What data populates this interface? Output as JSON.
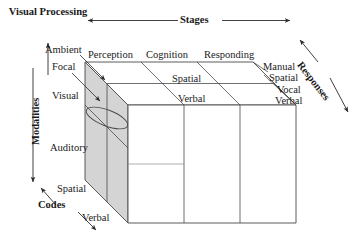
{
  "diagram": {
    "type": "3d-cube-model",
    "title_label": "Visual Processing",
    "axes": {
      "top": "Stages",
      "left": "Modalities",
      "right": "Responses",
      "bottom_left": "Codes"
    },
    "stages": [
      "Perception",
      "Cognition",
      "Responding"
    ],
    "top_face_codes": [
      "Spatial",
      "Verbal"
    ],
    "visual_processing_types": [
      "Ambient",
      "Focal"
    ],
    "modalities": [
      "Visual",
      "Auditory"
    ],
    "front_face_codes": [
      "Spatial",
      "Verbal"
    ],
    "responses": [
      "Manual",
      "Spatial",
      "Vocal",
      "Verbal"
    ],
    "colors": {
      "face_fill": "#d4d4d4",
      "line": "#3a3a3a",
      "text": "#1a1a1a",
      "background": "#ffffff"
    }
  }
}
